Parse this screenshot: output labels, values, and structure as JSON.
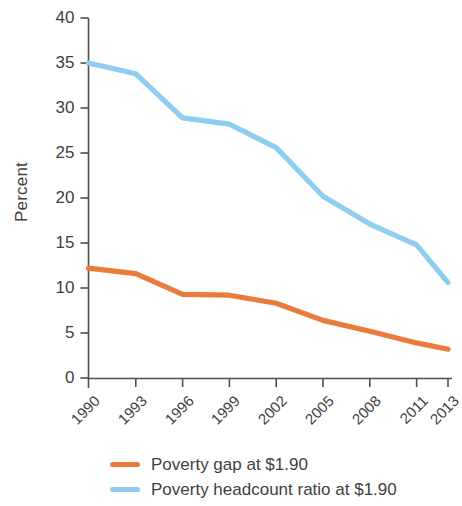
{
  "chart_data": {
    "type": "line",
    "title": "",
    "xlabel": "",
    "ylabel": "Percent",
    "x": [
      1990,
      1993,
      1996,
      1999,
      2002,
      2005,
      2008,
      2011,
      2013
    ],
    "categories": [
      "1990",
      "1993",
      "1996",
      "1999",
      "2002",
      "2005",
      "2008",
      "2011",
      "2013"
    ],
    "ylim": [
      0,
      40
    ],
    "yticks": [
      0,
      5,
      10,
      15,
      20,
      25,
      30,
      35,
      40
    ],
    "ytick_labels": [
      "0",
      "5",
      "10",
      "15",
      "20",
      "25",
      "30",
      "35",
      "40"
    ],
    "grid": false,
    "legend_position": "bottom",
    "series": [
      {
        "name": "Poverty gap at $1.90",
        "color": "#EA7B3C",
        "values": [
          12.2,
          11.6,
          9.3,
          9.2,
          8.3,
          6.4,
          5.2,
          3.9,
          3.2
        ]
      },
      {
        "name": "Poverty headcount ratio at $1.90",
        "color": "#8FCDF0",
        "values": [
          35.0,
          33.8,
          28.9,
          28.2,
          25.6,
          20.2,
          17.1,
          14.8,
          10.6
        ]
      }
    ]
  },
  "axis": {
    "y_label": "Percent"
  },
  "legend": {
    "items": [
      {
        "label": "Poverty gap at $1.90",
        "color": "#EA7B3C"
      },
      {
        "label": "Poverty headcount ratio at $1.90",
        "color": "#8FCDF0"
      }
    ]
  }
}
